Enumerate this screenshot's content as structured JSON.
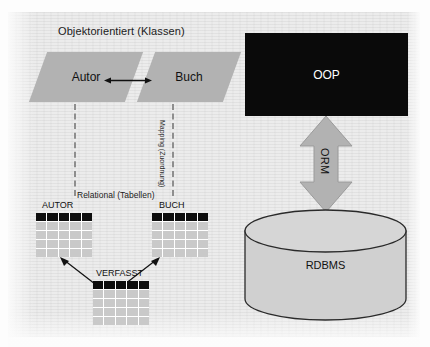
{
  "diagram": {
    "left_section": {
      "title": "Objektorientiert (Klassen)",
      "classes": [
        {
          "name": "Autor"
        },
        {
          "name": "Buch"
        }
      ],
      "association": "bidirectional-association",
      "mapping_label": "Mapping (Zuordnung)",
      "relational_title": "Relational (Tabellen)",
      "tables": [
        {
          "caption": "AUTOR",
          "columns": 5,
          "body_rows": 4
        },
        {
          "caption": "BUCH",
          "columns": 5,
          "body_rows": 4
        },
        {
          "caption": "VERFASST",
          "columns": 5,
          "body_rows": 4
        }
      ]
    },
    "right_section": {
      "top_box": "OOP",
      "arrow_label": "ORM",
      "bottom_store": "RDBMS"
    },
    "colors": {
      "shape_gray": "#b2b2b2",
      "cylinder_gray": "#d0d0d0",
      "header_black": "#0d0d0d",
      "cell_gray": "#c9c9c9",
      "background": "#ececec",
      "text": "#1b1b1b"
    }
  }
}
